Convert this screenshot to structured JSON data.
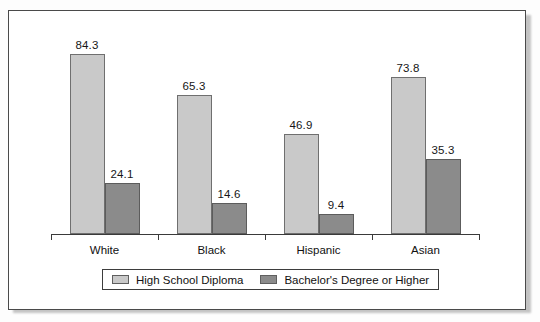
{
  "figure": {
    "background_color": "#ffffff",
    "border_color": "#4a4a4a"
  },
  "legend": {
    "position": "bottom-center",
    "entries": [
      {
        "label": "High School Diploma",
        "color": "#c9c9c9",
        "swatch_name": "legend-swatch-high-school-diploma"
      },
      {
        "label": "Bachelor's Degree or Higher",
        "color": "#8b8b8b",
        "swatch_name": "legend-swatch-bachelors-degree-or-higher"
      }
    ]
  },
  "chart_data": {
    "type": "bar",
    "title": "",
    "subtitle": "",
    "xlabel": "",
    "ylabel": "",
    "ylim": [
      0,
      100
    ],
    "grid": false,
    "legend_position": "bottom-center",
    "categories": [
      "White",
      "Black",
      "Hispanic",
      "Asian"
    ],
    "series": [
      {
        "name": "High School Diploma",
        "color": "#c9c9c9",
        "values": [
          84.3,
          65.3,
          46.9,
          73.8
        ],
        "labels": [
          "84.3",
          "65.3",
          "46.9",
          "73.8"
        ]
      },
      {
        "name": "Bachelor's Degree or Higher",
        "color": "#8b8b8b",
        "values": [
          24.1,
          14.6,
          9.4,
          35.3
        ],
        "labels": [
          "24.1",
          "14.6",
          "9.4",
          "35.3"
        ]
      }
    ]
  }
}
